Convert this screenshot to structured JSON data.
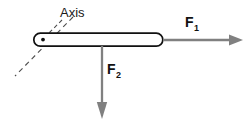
{
  "canvas": {
    "width": 249,
    "height": 128,
    "background": "#ffffff"
  },
  "diagram": {
    "kind": "free-body-torque-diagram",
    "axis_annotation": {
      "label": "Axis",
      "label_x": 60,
      "label_y": 16,
      "leader_from": [
        62,
        20
      ],
      "leader_to": [
        47,
        35
      ],
      "dashed_line_from": [
        73,
        17
      ],
      "dashed_line_to": [
        15,
        76
      ],
      "color": "#4d4d4d"
    },
    "rod": {
      "name": "rigid-rod",
      "x": 33,
      "y": 33,
      "width": 130,
      "height": 13,
      "corner_radius": 6.5,
      "fill": "#ffffff",
      "stroke": "#111111",
      "stroke_width": 1.6
    },
    "pivot": {
      "name": "pivot-point",
      "cx": 43,
      "cy": 39.5,
      "r": 1.9,
      "fill": "#111111"
    },
    "forces": [
      {
        "id": "f1",
        "label": "F",
        "subscript": "1",
        "direction": "right",
        "from": [
          163,
          40
        ],
        "to": [
          243,
          40
        ],
        "label_x": 185,
        "label_y": 26,
        "color": "#808080",
        "shaft_width": 2.2,
        "head_length": 14,
        "head_width": 11
      },
      {
        "id": "f2",
        "label": "F",
        "subscript": "2",
        "direction": "down",
        "from": [
          102,
          46
        ],
        "to": [
          102,
          118
        ],
        "label_x": 108,
        "label_y": 74,
        "color": "#808080",
        "shaft_width": 2.2,
        "head_length": 16,
        "head_width": 11
      }
    ]
  }
}
